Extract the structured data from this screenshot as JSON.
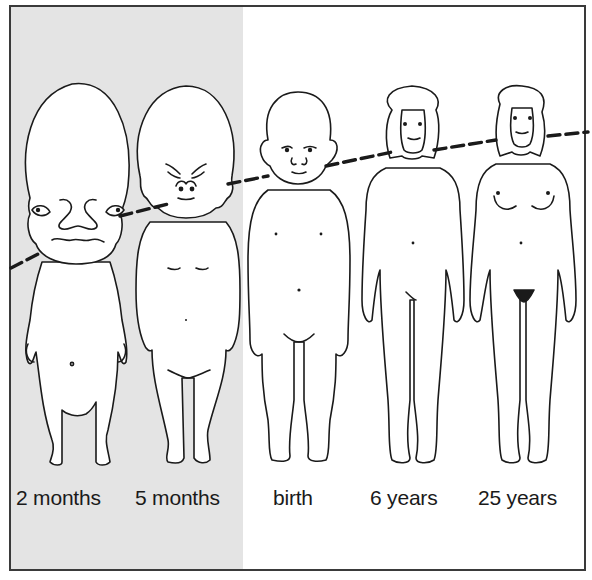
{
  "figure": {
    "frame_color": "#3a3a3a",
    "prenatal_shade_color": "#e4e4e4",
    "line_color": "#1a1a1a",
    "stages": [
      {
        "id": "2-months",
        "label": "2 months",
        "prenatal": true
      },
      {
        "id": "5-months",
        "label": "5 months",
        "prenatal": true
      },
      {
        "id": "birth",
        "label": "birth",
        "prenatal": false
      },
      {
        "id": "6-years",
        "label": "6 years",
        "prenatal": false
      },
      {
        "id": "25-years",
        "label": "25 years",
        "prenatal": false
      }
    ],
    "reference_line": {
      "style": "dashed",
      "meaning": "neck/chin level across stages"
    }
  }
}
